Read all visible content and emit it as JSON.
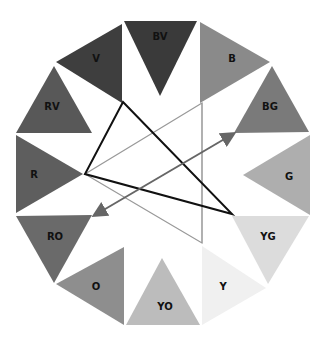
{
  "segments": [
    {
      "key": "bv",
      "label": "BV",
      "color": "#3a3a3a",
      "points": "124,21 197,21 160,96",
      "lx": 160,
      "ly": 40
    },
    {
      "key": "b",
      "label": "B",
      "color": "#8a8a8a",
      "points": "200,22 270,62 200,103",
      "lx": 232,
      "ly": 62
    },
    {
      "key": "bg",
      "label": "BG",
      "color": "#7a7a7a",
      "points": "272,66 309,132 234,133",
      "lx": 270,
      "ly": 110
    },
    {
      "key": "g",
      "label": "G",
      "color": "#aeaeae",
      "points": "310,135 310,215 243,175",
      "lx": 289,
      "ly": 180
    },
    {
      "key": "yg",
      "label": "YG",
      "color": "#dcdcdc",
      "points": "232,216 309,216 268,284",
      "lx": 268,
      "ly": 240
    },
    {
      "key": "y",
      "label": "Y",
      "color": "#f0f0f0",
      "points": "202,246 266,288 202,325",
      "lx": 223,
      "ly": 290
    },
    {
      "key": "yo",
      "label": "YO",
      "color": "#bcbcbc",
      "points": "162,258 200,325 126,325",
      "lx": 165,
      "ly": 310
    },
    {
      "key": "o",
      "label": "O",
      "color": "#8e8e8e",
      "points": "124,247 124,325 56,284",
      "lx": 96,
      "ly": 290
    },
    {
      "key": "ro",
      "label": "RO",
      "color": "#6a6a6a",
      "points": "16,216 92,215 54,283",
      "lx": 55,
      "ly": 240
    },
    {
      "key": "r",
      "label": "R",
      "color": "#5e5e5e",
      "points": "16,135 16,213 83,174",
      "lx": 34,
      "ly": 178
    },
    {
      "key": "rv",
      "label": "RV",
      "color": "#585858",
      "points": "54,66 92,133 16,133",
      "lx": 52,
      "ly": 110
    },
    {
      "key": "v",
      "label": "V",
      "color": "#3e3e3e",
      "points": "122,24 122,103 56,62",
      "lx": 96,
      "ly": 62
    }
  ],
  "lines": {
    "triad_dark": {
      "points": "123,102 85,174 232,214",
      "color": "#111111",
      "width": 2
    },
    "triad_light": {
      "points": "202,103 85,174 202,243",
      "color": "#999999",
      "width": 1.2
    },
    "vertical_light": {
      "x1": 202,
      "y1": 103,
      "x2": 202,
      "y2": 243,
      "color": "#aaaaaa",
      "width": 1
    },
    "complement_arrow": {
      "x1": 95,
      "y1": 215,
      "x2": 233,
      "y2": 134,
      "color": "#666666",
      "width": 2
    }
  }
}
